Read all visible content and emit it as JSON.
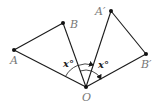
{
  "figure": {
    "type": "rotation-diagram",
    "points": {
      "A": {
        "label": "A",
        "x": 14,
        "y": 50
      },
      "B": {
        "label": "B",
        "x": 63,
        "y": 23
      },
      "A_prime": {
        "label": "A′",
        "x": 111,
        "y": 11
      },
      "B_prime": {
        "label": "B′",
        "x": 146,
        "y": 54
      },
      "O": {
        "label": "O",
        "x": 86,
        "y": 87
      }
    },
    "segments": [
      [
        "O",
        "A"
      ],
      [
        "A",
        "B"
      ],
      [
        "B",
        "O"
      ],
      [
        "O",
        "A_prime"
      ],
      [
        "A_prime",
        "B_prime"
      ],
      [
        "B_prime",
        "O"
      ]
    ],
    "angles": [
      {
        "from": "OA",
        "to": "OA′",
        "label": "x°"
      },
      {
        "from": "OB",
        "to": "OB′",
        "label": "x°"
      }
    ],
    "colors": {
      "line": "#1a1a1a",
      "label": "#777777"
    }
  }
}
